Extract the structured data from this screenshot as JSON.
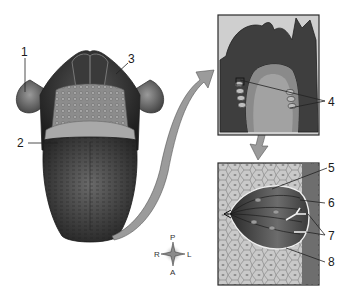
{
  "figure": {
    "colors": {
      "tongue_dark": "#2e2e2e",
      "tongue_mid": "#555555",
      "papillae": "#9a9a9a",
      "arrow": "#9b9b9b",
      "frame": "#3a3a3a",
      "inset_bg": "#bdbdbd"
    },
    "labels": [
      {
        "id": "1",
        "text": "1"
      },
      {
        "id": "2",
        "text": "2"
      },
      {
        "id": "3",
        "text": "3"
      },
      {
        "id": "4",
        "text": "4"
      },
      {
        "id": "5",
        "text": "5"
      },
      {
        "id": "6",
        "text": "6"
      },
      {
        "id": "7",
        "text": "7"
      },
      {
        "id": "8",
        "text": "8"
      }
    ],
    "compass": {
      "top": "P",
      "bottom": "A",
      "left": "R",
      "right": "L"
    }
  }
}
